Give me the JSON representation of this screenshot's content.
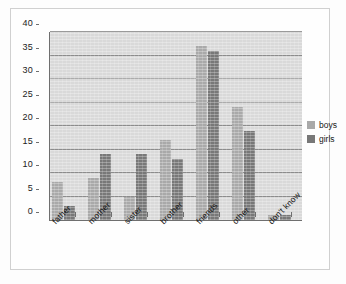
{
  "chart_data": {
    "type": "bar",
    "title": "",
    "xlabel": "",
    "ylabel": "",
    "categories": [
      "father",
      "mother",
      "sister",
      "brother",
      "friends",
      "other",
      "don't know"
    ],
    "series": [
      {
        "name": "boys",
        "color": "#a9a9a9",
        "values": [
          8,
          9,
          5,
          17,
          37,
          24,
          1
        ]
      },
      {
        "name": "girls",
        "color": "#787878",
        "values": [
          3,
          14,
          14,
          13,
          36,
          19,
          1
        ]
      }
    ],
    "ylim": [
      0,
      40
    ],
    "ytick_labels": [
      "0",
      "5",
      "10",
      "15",
      "20",
      "25",
      "30",
      "35",
      "40"
    ],
    "ytick_values": [
      0,
      5,
      10,
      15,
      20,
      25,
      30,
      35,
      40
    ],
    "grid": true,
    "legend_position": "right",
    "plot_background": "#d9d9d9",
    "axis_color": "#6f6f6f",
    "gridline_color": "#8c8c8c"
  },
  "legend": {
    "items": [
      {
        "label": "boys"
      },
      {
        "label": "girls"
      }
    ]
  }
}
